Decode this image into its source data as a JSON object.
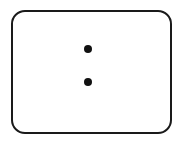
{
  "figure": {
    "title": "Rounded rectangle containing two vertically stacked dots",
    "type": "line-drawing",
    "canvas": {
      "width": 186,
      "height": 144,
      "background_color": "#ffffff"
    },
    "shapes": {
      "frame": {
        "name": "rounded-rectangle",
        "x": 11,
        "y": 10,
        "width": 161,
        "height": 124,
        "corner_radius": 13,
        "stroke_color": "#1a1a1a",
        "stroke_width": 2,
        "fill_color": "#ffffff"
      },
      "dots": [
        {
          "name": "upper-dot",
          "cx": 88,
          "cy": 49,
          "r": 4,
          "fill_color": "#111111"
        },
        {
          "name": "lower-dot",
          "cx": 88,
          "cy": 82,
          "r": 4,
          "fill_color": "#111111"
        }
      ]
    },
    "counts": {
      "dot_count": "2",
      "frame_count": "1"
    },
    "labels": {
      "caption": ""
    }
  }
}
